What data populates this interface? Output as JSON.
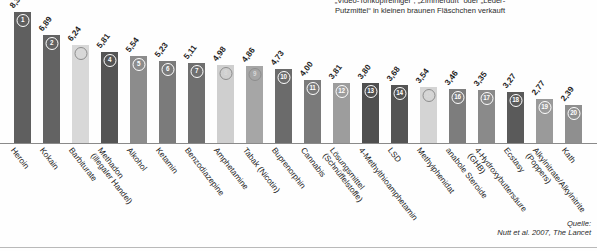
{
  "topnote": "„Video-Tonkopfreiniger“, „Zimmerduft“ oder „Leder-\nPutzmittel“ in kleinen braunen Fläschchen verkauft",
  "source": "Quelle:\nNutt et al. 2007, The Lancet",
  "chart_data": {
    "type": "bar",
    "title": "",
    "xlabel": "",
    "ylabel": "",
    "ylim": [
      0,
      8.32
    ],
    "grid": false,
    "legend": "none",
    "orientation": "vertical",
    "categories": [
      "Heroin",
      "Kokain",
      "Barbiturate",
      "Methadon\n(illegaler Handel)",
      "Alkohol",
      "Ketamin",
      "Benzodiazepine",
      "Amphetamine",
      "Tabak (Nicotin)",
      "Buprenorphin",
      "Cannabis",
      "Lösungsmittel\n(Schnüffelstoffe)",
      "4-Methylthioamphetamin",
      "LSD",
      "Methylphenidat",
      "anabole Steroide",
      "4-Hydroxybuttersäure\n(GHB)",
      "Ecstasy",
      "Alkylnitrate/Alkylnitrite\n(Poppers)",
      "Kath"
    ],
    "values": [
      8.32,
      6.89,
      6.24,
      5.81,
      5.54,
      5.23,
      5.11,
      4.98,
      4.86,
      4.73,
      4.0,
      3.81,
      3.8,
      3.68,
      3.54,
      3.46,
      3.35,
      3.27,
      2.77,
      2.39
    ],
    "value_labels": [
      "8,32",
      "6,89",
      "6,24",
      "5,81",
      "5,54",
      "5,23",
      "5,11",
      "4,98",
      "4,86",
      "4,73",
      "4,00",
      "3,81",
      "3,80",
      "3,68",
      "3,54",
      "3,46",
      "3,35",
      "3,27",
      "2,77",
      "2,39"
    ],
    "ranks": [
      "1",
      "2",
      "3",
      "4",
      "5",
      "6",
      "7",
      "8",
      "9",
      "10",
      "11",
      "12",
      "13",
      "14",
      "15",
      "16",
      "17",
      "18",
      "19",
      "20"
    ],
    "bar_colors": [
      "#5f5f5f",
      "#636363",
      "#d8d8d8",
      "#545454",
      "#8c8c8c",
      "#7b7b7b",
      "#6f6f6f",
      "#cfcfcf",
      "#a6a6a6",
      "#6b6b6b",
      "#7a7a7a",
      "#9d9d9d",
      "#4f4f4f",
      "#545454",
      "#d4d4d4",
      "#7d7d7d",
      "#8a8a8a",
      "#5a5a5a",
      "#9a9a9a",
      "#8f8f8f"
    ]
  }
}
